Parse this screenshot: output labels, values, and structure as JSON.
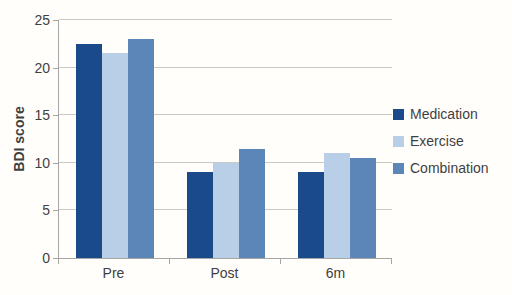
{
  "chart_data": {
    "type": "bar",
    "title": "",
    "xlabel": "",
    "ylabel": "BDI score",
    "categories": [
      "Pre",
      "Post",
      "6m"
    ],
    "series": [
      {
        "name": "Medication",
        "color": "#1B4A8A",
        "values": [
          22.5,
          9,
          9
        ]
      },
      {
        "name": "Exercise",
        "color": "#B9CFE8",
        "values": [
          21.5,
          10,
          11
        ]
      },
      {
        "name": "Combination",
        "color": "#5C85B8",
        "values": [
          23,
          11.5,
          10.5
        ]
      }
    ],
    "ylim": [
      0,
      25
    ],
    "yticks": [
      0,
      5,
      10,
      15,
      20,
      25
    ],
    "grid": true,
    "legend_position": "right"
  },
  "colors": {
    "gridline": "#c9c9c9",
    "axis": "#a6a6a6",
    "text": "#3f3f3f",
    "background": "#fffefb"
  }
}
